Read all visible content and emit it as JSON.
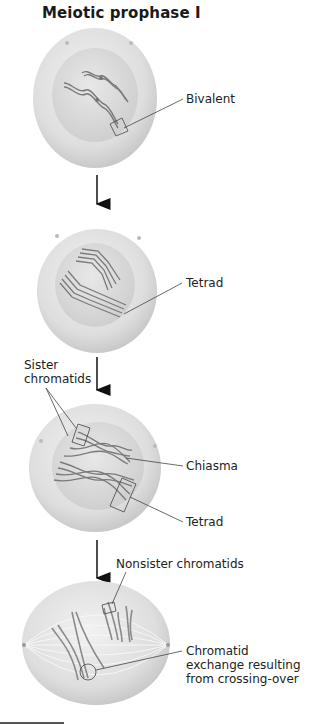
{
  "title": "Meiotic prophase I",
  "stages": [
    {
      "labels": [
        "Bivalent"
      ]
    },
    {
      "labels": [
        "Tetrad"
      ]
    },
    {
      "labels": [
        "Sister chromatids",
        "Chiasma",
        "Tetrad"
      ]
    },
    {
      "labels": [
        "Nonsister chromatids",
        "Chromatid exchange resulting from crossing-over"
      ]
    }
  ],
  "label_lines": {
    "sister_1": "Sister",
    "sister_2": "chromatids",
    "exchange_1": "Chromatid",
    "exchange_2": "exchange resulting",
    "exchange_3": "from crossing-over"
  },
  "colors": {
    "cell": "#e4e4e4",
    "nucleus": "#d6d6d6",
    "chromosome": "#7a7a7a",
    "leader": "#444444",
    "arrow": "#111111"
  }
}
